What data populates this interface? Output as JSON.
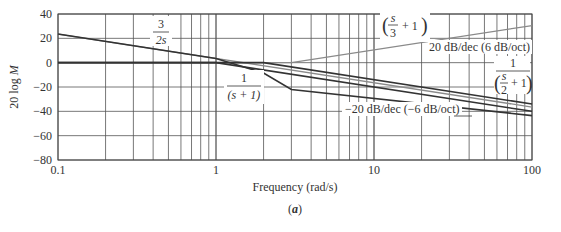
{
  "chart_data": {
    "type": "line",
    "title": "",
    "caption": "(a)",
    "xlabel": "Frequency (rad/s)",
    "ylabel": "20 log M",
    "xscale": "log",
    "xlim": [
      0.1,
      100
    ],
    "ylim": [
      -80,
      40
    ],
    "grid": true,
    "x_ticks": [
      "0.1",
      "1",
      "10",
      "100"
    ],
    "y_ticks": [
      "40",
      "20",
      "0",
      "−20",
      "−40",
      "−60",
      "−80"
    ],
    "series": [
      {
        "name": "3/(2s)",
        "color": "#8a8a8a",
        "x": [
          0.1,
          100
        ],
        "y": [
          23.5,
          -36.5
        ]
      },
      {
        "name": "(s/3 + 1)",
        "color": "#8a8a8a",
        "x": [
          0.1,
          3,
          100
        ],
        "y": [
          0,
          0,
          30.5
        ]
      },
      {
        "name": "1/(s+1)",
        "color": "#333333",
        "x": [
          0.1,
          1,
          100
        ],
        "y": [
          0,
          0,
          -40
        ]
      },
      {
        "name": "1/(s/2 + 1)",
        "color": "#333333",
        "x": [
          0.1,
          2,
          100
        ],
        "y": [
          0,
          0,
          -34
        ]
      },
      {
        "name": "Total",
        "color": "#333333",
        "x": [
          0.1,
          1,
          2,
          3,
          100
        ],
        "y": [
          23.5,
          3.5,
          -8.5,
          -22.0,
          -43.5
        ]
      }
    ],
    "annotations": [
      {
        "text": "3/(2s)"
      },
      {
        "text": "(s/3 + 1)"
      },
      {
        "text": "20 dB/dec (6 dB/oct)"
      },
      {
        "text": "1/(s/2 + 1)"
      },
      {
        "text": "1/(s + 1)"
      },
      {
        "text": "−20 dB/dec (−6 dB/oct)"
      }
    ]
  },
  "labels": {
    "xlabel": "Frequency (rad/s)",
    "ylabel_prefix": "20 log ",
    "ylabel_var": "M",
    "caption": "a",
    "slope_up": "20 dB/dec (6 dB/oct)",
    "slope_down": "−20 dB/dec (−6 dB/oct)",
    "num_1": "1",
    "num_3": "3",
    "den_2s": "2s",
    "den_s1": "(s + 1)",
    "plus1": "+ 1",
    "s": "s",
    "three": "3",
    "two": "2"
  }
}
